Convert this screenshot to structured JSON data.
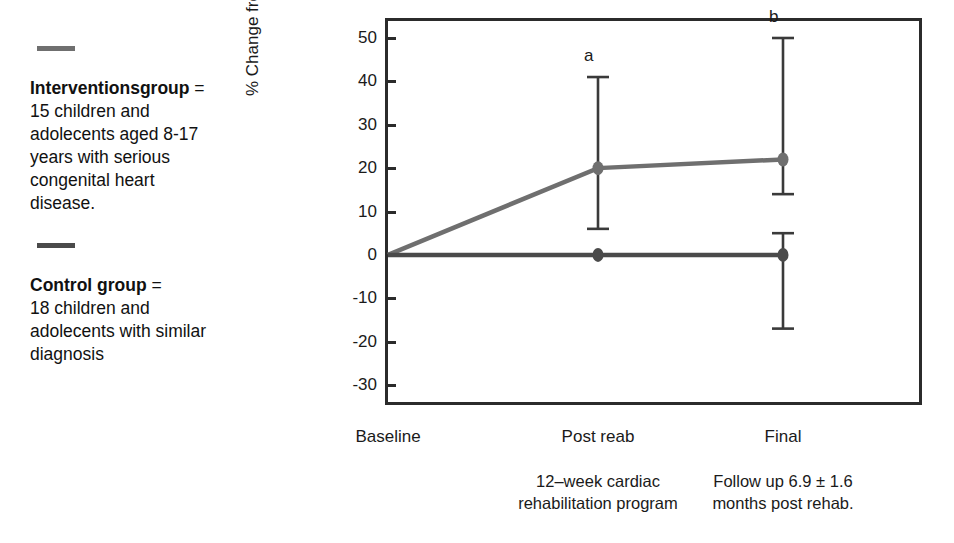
{
  "legend": {
    "items": [
      {
        "swatch_color": "#6f6f6f",
        "title": "Interventionsgroup",
        "equals": "=",
        "lines": [
          "15 children and",
          "adolecents aged 8-17",
          "years with serious",
          "congenital heart",
          "disease."
        ]
      },
      {
        "swatch_color": "#4a4a4a",
        "title": "Control group",
        "equals": "=",
        "lines": [
          "18 children and",
          "adolecents with similar",
          "diagnosis"
        ]
      }
    ]
  },
  "chart_data": {
    "type": "line",
    "title": "",
    "xlabel": "",
    "ylabel": "% Change from baseline",
    "categories": [
      "Baseline",
      "Post reab",
      "Final"
    ],
    "yticks": [
      50,
      40,
      30,
      20,
      10,
      0,
      -10,
      -20,
      -30
    ],
    "ylim": [
      -30,
      50
    ],
    "grid": false,
    "legend_position": "left-outside",
    "series": [
      {
        "name": "Interventionsgroup",
        "color": "#6f6f6f",
        "values": [
          0,
          20,
          22
        ],
        "err_low": [
          0,
          6,
          14
        ],
        "err_high": [
          0,
          41,
          50
        ]
      },
      {
        "name": "Control group",
        "color": "#4a4a4a",
        "values": [
          0,
          0,
          0
        ],
        "err_low": [
          0,
          0,
          -17
        ],
        "err_high": [
          0,
          0,
          5
        ]
      }
    ],
    "annotations": [
      {
        "text": "a",
        "x_category": "Post reab",
        "y": 46
      },
      {
        "text": "b",
        "x_category": "Final",
        "y": 55
      }
    ],
    "x_notes": [
      {
        "under": "Post reab",
        "lines": [
          "12–week cardiac",
          "rehabilitation program"
        ]
      },
      {
        "under": "Final",
        "lines": [
          "Follow up 6.9 ± 1.6",
          "months post rehab."
        ]
      }
    ]
  }
}
